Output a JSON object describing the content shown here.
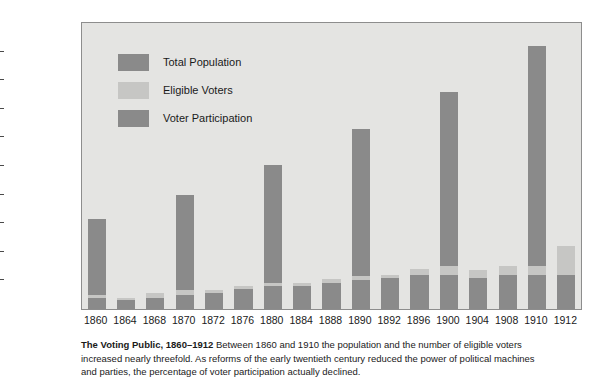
{
  "chart_data": {
    "type": "bar",
    "subtype": "stacked-bar",
    "title": "The Voting Public, 1860–1912",
    "xlabel": "",
    "ylabel": "Number of People (Millions)",
    "ylim": [
      0,
      100
    ],
    "ytick_step": 10,
    "yticks": [
      0,
      10,
      20,
      30,
      40,
      50,
      60,
      70,
      80,
      90,
      100
    ],
    "grid": false,
    "legend_position": "upper-left-inside",
    "categories": [
      1860,
      1864,
      1868,
      1870,
      1872,
      1876,
      1880,
      1884,
      1888,
      1890,
      1892,
      1896,
      1900,
      1904,
      1908,
      1910,
      1912
    ],
    "series": [
      {
        "name": "Total Population",
        "color": "#8a8a8a",
        "values": [
          31.4,
          4.0,
          5.7,
          39.8,
          6.5,
          8.2,
          50.2,
          9.2,
          10.4,
          62.9,
          12.0,
          13.9,
          75.9,
          13.5,
          14.9,
          92.0,
          15.0
        ]
      },
      {
        "name": "Eligible Voters",
        "color": "#c6c6c4",
        "values": [
          5.0,
          4.0,
          5.7,
          6.5,
          6.5,
          8.2,
          9.2,
          9.2,
          10.4,
          11.5,
          12.0,
          13.9,
          15.0,
          13.5,
          14.9,
          15.0,
          15.0
        ]
      },
      {
        "name": "Voter Participation",
        "color": "#8a8a8a",
        "values": [
          4.0,
          3.0,
          4.0,
          5.0,
          5.5,
          7.0,
          8.0,
          8.0,
          9.0,
          10.0,
          11.0,
          12.0,
          12.0,
          11.0,
          12.0,
          12.0,
          12.0
        ]
      }
    ],
    "bar_tops_total": [
      31.4,
      4.0,
      5.7,
      39.8,
      6.5,
      8.2,
      50.2,
      9.2,
      10.4,
      62.9,
      12.0,
      13.9,
      75.9,
      13.5,
      14.9,
      92.0,
      15.0
    ],
    "bar_tops_eligible": [
      5.0,
      4.0,
      5.7,
      6.5,
      6.5,
      8.2,
      9.2,
      9.2,
      10.4,
      11.5,
      12.0,
      13.9,
      15.0,
      13.5,
      14.9,
      15.0,
      22.0
    ],
    "bar_tops_voter": [
      4.0,
      3.0,
      4.0,
      5.0,
      5.5,
      7.0,
      8.0,
      8.0,
      9.0,
      10.0,
      11.0,
      12.0,
      12.0,
      11.0,
      12.0,
      12.0,
      12.0
    ]
  },
  "legend": {
    "items": [
      {
        "label": "Total Population",
        "color": "#8a8a8a"
      },
      {
        "label": "Eligible Voters",
        "color": "#c6c6c4"
      },
      {
        "label": "Voter Participation",
        "color": "#8a8a8a"
      }
    ]
  },
  "axes": {
    "y_title": "Number of People (Millions)",
    "y_labels": [
      "100",
      "90",
      "80",
      "70",
      "60",
      "50",
      "40",
      "30",
      "20",
      "10",
      "0"
    ],
    "x_labels": [
      "1860",
      "1864",
      "1868",
      "1870",
      "1872",
      "1876",
      "1880",
      "1884",
      "1888",
      "1890",
      "1892",
      "1896",
      "1900",
      "1904",
      "1908",
      "1910",
      "1912"
    ]
  },
  "caption": {
    "title": "The Voting Public, 1860–1912",
    "body": " Between 1860 and 1910 the population and the number of eligible voters increased nearly threefold. As reforms of the early twentieth century reduced the power of political machines and parties, the percentage of voter participation actually declined."
  },
  "colors": {
    "plot_background": "#e4e4e2",
    "page_background": "#ffffff",
    "dark_gray": "#8a8a8a",
    "light_gray": "#c6c6c4",
    "text": "#1a1a1a",
    "frame": "#8d8d8d"
  }
}
